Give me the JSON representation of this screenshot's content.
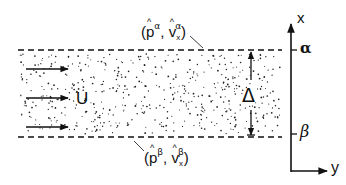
{
  "diagram": {
    "type": "shear-layer-schematic",
    "layer": {
      "fill": "stippled",
      "top_boundary_style": "dashed",
      "bottom_boundary_style": "dashed"
    },
    "flow_label": "U",
    "thickness_label": "Δ",
    "top_boundary_label": {
      "open": "(",
      "p": "p",
      "p_sup": "α",
      "comma": ", ",
      "v": "v",
      "v_sub": "x",
      "v_sup": "α",
      "close": ")"
    },
    "bottom_boundary_label": {
      "open": "(",
      "p": "p",
      "p_sup": "β",
      "comma": ", ",
      "v": "v",
      "v_sub": "x",
      "v_sup": "β",
      "close": ")"
    },
    "axes": {
      "vertical_label": "x",
      "horizontal_label": "y",
      "tick_top_label": "α",
      "tick_bottom_label": "β"
    },
    "colors": {
      "ink": "#111111",
      "background": "#ffffff"
    }
  }
}
